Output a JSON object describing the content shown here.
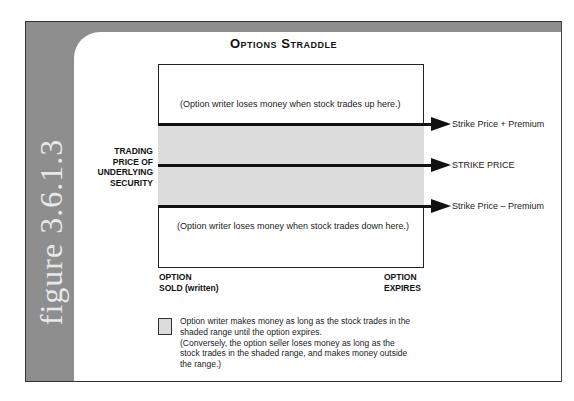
{
  "figure": {
    "label": "figure 3.6.1.3",
    "title": "Options Straddle"
  },
  "diagram": {
    "y_axis_label": [
      "TRADING",
      "PRICE OF",
      "UNDERLYING",
      "SECURITY"
    ],
    "x_axis_start": [
      "OPTION",
      "SOLD (written)"
    ],
    "x_axis_end": [
      "OPTION",
      "EXPIRES"
    ],
    "upper_note": "(Option writer loses money when stock trades up here.)",
    "lower_note": "(Option writer loses money when stock trades down here.)",
    "levels": [
      {
        "label": "Strike Price + Premium"
      },
      {
        "label": "STRIKE PRICE"
      },
      {
        "label": "Strike Price – Premium"
      }
    ],
    "shade_color": "#dcdcdc",
    "line_color": "#111111"
  },
  "legend": {
    "lines": [
      "Option writer makes money as long as the stock trades in the",
      "shaded range until the option expires.",
      "(Conversely, the option seller loses money as long as the",
      "stock trades in the shaded range, and makes money outside",
      "the range.)"
    ]
  }
}
